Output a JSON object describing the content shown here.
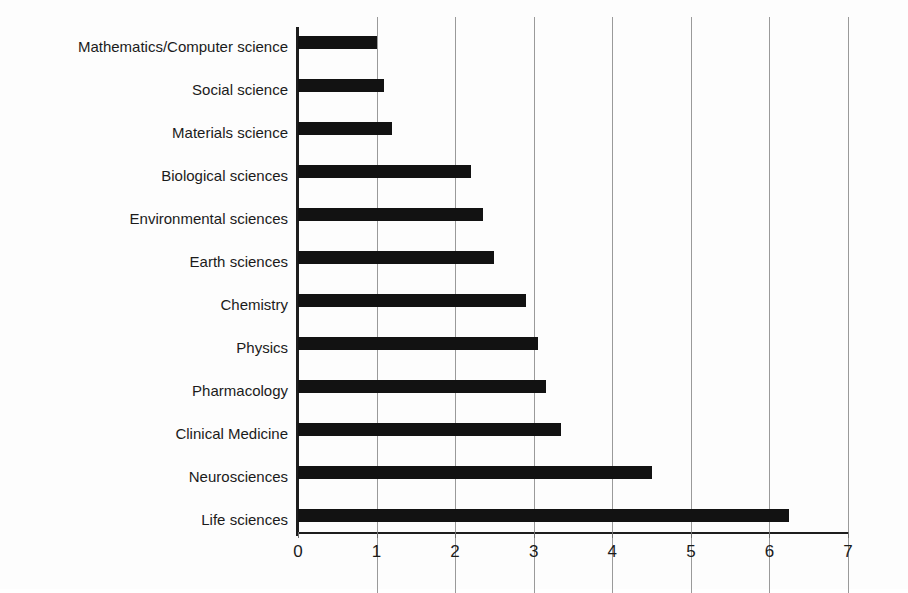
{
  "chart_data": {
    "type": "bar",
    "orientation": "horizontal",
    "title": "",
    "subtitle": "",
    "xlabel": "",
    "ylabel": "",
    "xlim": [
      0,
      7.3
    ],
    "xticks": [
      0,
      1,
      2,
      3,
      4,
      5,
      6,
      7
    ],
    "xtick_labels": [
      "0",
      "1",
      "2",
      "3",
      "4",
      "5",
      "6",
      "7"
    ],
    "grid": "vertical",
    "legend": "none",
    "bar_color": "#121212",
    "axis_color": "#1d1d1d",
    "gridline_color": "#9a9a9a",
    "background_color": "#fdfdfd",
    "categories": [
      "Mathematics/Computer science",
      "Social science",
      "Materials science",
      "Biological sciences",
      "Environmental sciences",
      "Earth sciences",
      "Chemistry",
      "Physics",
      "Pharmacology",
      "Clinical Medicine",
      "Neurosciences",
      "Life sciences"
    ],
    "values": [
      1.0,
      1.1,
      1.2,
      2.2,
      2.35,
      2.5,
      2.9,
      3.05,
      3.15,
      3.35,
      4.5,
      6.25
    ]
  }
}
